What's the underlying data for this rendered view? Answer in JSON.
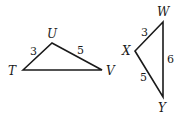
{
  "diagram": {
    "type": "geometry-triangles",
    "triangles": [
      {
        "name": "TUV",
        "vertices": [
          {
            "label": "T",
            "x": 23,
            "y": 70,
            "label_x": 8,
            "label_y": 75
          },
          {
            "label": "U",
            "x": 52,
            "y": 43,
            "label_x": 47,
            "label_y": 38
          },
          {
            "label": "V",
            "x": 102,
            "y": 70,
            "label_x": 106,
            "label_y": 75
          }
        ],
        "sides": [
          {
            "between": "TU",
            "length": "3",
            "label_x": 30,
            "label_y": 55
          },
          {
            "between": "UV",
            "length": "5",
            "label_x": 77,
            "label_y": 54
          },
          {
            "between": "TV",
            "length": "",
            "label_x": 0,
            "label_y": 0
          }
        ]
      },
      {
        "name": "WXY",
        "vertices": [
          {
            "label": "W",
            "x": 163,
            "y": 22,
            "label_x": 157,
            "label_y": 16
          },
          {
            "label": "X",
            "x": 135,
            "y": 51,
            "label_x": 122,
            "label_y": 55
          },
          {
            "label": "Y",
            "x": 163,
            "y": 97,
            "label_x": 158,
            "label_y": 112
          }
        ],
        "sides": [
          {
            "between": "WX",
            "length": "3",
            "label_x": 141,
            "label_y": 36
          },
          {
            "between": "XY",
            "length": "5",
            "label_x": 140,
            "label_y": 81
          },
          {
            "between": "WY",
            "length": "6",
            "label_x": 167,
            "label_y": 63
          }
        ]
      }
    ],
    "labels": {
      "T": "T",
      "U": "U",
      "V": "V",
      "W": "W",
      "X": "X",
      "Y": "Y",
      "TU": "3",
      "UV": "5",
      "WX": "3",
      "XY": "5",
      "WY": "6"
    }
  }
}
